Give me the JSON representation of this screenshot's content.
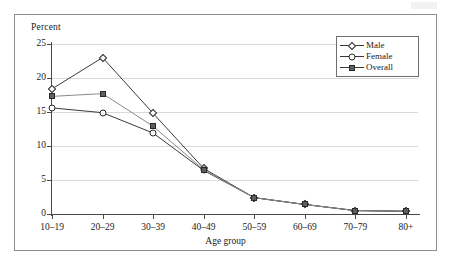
{
  "figure": {
    "percent_axis_label": "Percent",
    "xaxis_title": "Age group"
  },
  "legend": {
    "position": "top-right inside plot",
    "entries": [
      {
        "label": "Male",
        "marker": "diamond-open",
        "color": "#2a2a2a"
      },
      {
        "label": "Female",
        "marker": "circle-open",
        "color": "#2a2a2a"
      },
      {
        "label": "Overall",
        "marker": "square-filled",
        "color": "#5e5e5e"
      }
    ]
  },
  "chart_data": {
    "type": "line",
    "title": "",
    "subtitle": "",
    "xlabel": "Age group",
    "ylabel": "Percent",
    "categories": [
      "10–19",
      "20–29",
      "30–39",
      "40–49",
      "50–59",
      "60–69",
      "70–79",
      "80+"
    ],
    "series": [
      {
        "name": "Male",
        "marker": "diamond-open",
        "values": [
          18.4,
          23.0,
          14.8,
          6.7,
          2.4,
          1.4,
          0.5,
          0.4
        ]
      },
      {
        "name": "Female",
        "marker": "circle-open",
        "values": [
          15.6,
          14.9,
          11.9,
          6.4,
          2.4,
          1.4,
          0.5,
          0.4
        ]
      },
      {
        "name": "Overall",
        "marker": "square-filled",
        "values": [
          17.3,
          17.7,
          12.9,
          6.5,
          2.4,
          1.4,
          0.5,
          0.4
        ]
      }
    ],
    "ylim": [
      0,
      25
    ],
    "yticks": [
      0,
      5,
      10,
      15,
      20,
      25
    ],
    "ytick_labels": [
      "0",
      "5",
      "10",
      "15",
      "20",
      "25"
    ],
    "grid": "horizontal",
    "legend_position": "upper right"
  }
}
